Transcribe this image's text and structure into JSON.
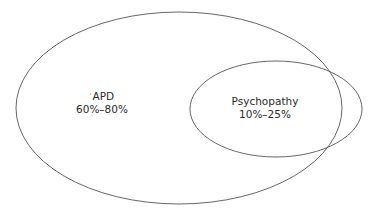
{
  "diagram": {
    "type": "venn",
    "stroke_color": "#555555",
    "background": "#ffffff",
    "sets": [
      {
        "id": "apd",
        "name": "APD",
        "range": "60%–80%",
        "marker": "ˈ",
        "shape": {
          "cx": 179,
          "cy": 108,
          "rx": 163,
          "ry": 96
        }
      },
      {
        "id": "psychopathy",
        "name": "Psychopathy",
        "range": "10%–25%",
        "shape": {
          "cx": 276,
          "cy": 109,
          "rx": 86,
          "ry": 48
        }
      }
    ]
  }
}
